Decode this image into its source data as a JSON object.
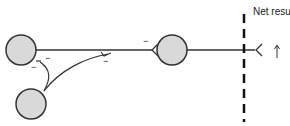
{
  "diagram": {
    "net_result_label": "Net result",
    "signs": [
      "−",
      "−",
      "−",
      "−"
    ],
    "arrow": "up-arrow",
    "colors": {
      "neuron_fill": "#d9d9d9",
      "neuron_stroke": "#333333",
      "line": "#333333"
    },
    "neurons": [
      {
        "id": "neuron-a",
        "cx": 21,
        "cy": 50,
        "r": 15
      },
      {
        "id": "neuron-b",
        "cx": 31,
        "cy": 104,
        "r": 15
      },
      {
        "id": "neuron-c",
        "cx": 172,
        "cy": 50,
        "r": 15
      }
    ]
  }
}
